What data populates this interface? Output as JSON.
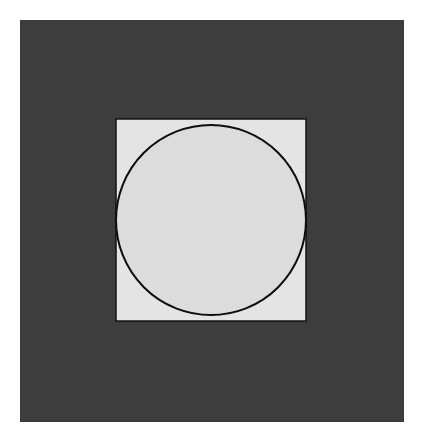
{
  "canvas": {
    "width": 421,
    "height": 442,
    "background_color": "#ffffff",
    "title": "Circle inscribed in square on dark background"
  },
  "chart_data": {
    "type": "diagram",
    "subtitle": "",
    "xlabel": "",
    "ylabel": "",
    "grid": false,
    "legend": null,
    "annotations": [],
    "shapes": [
      {
        "name": "outer-dark-panel",
        "type": "rect",
        "x": 20,
        "y": 20,
        "width": 384,
        "height": 402,
        "fill": "#3d3d3d",
        "stroke": "none",
        "stroke_width": 0
      },
      {
        "name": "inner-light-square",
        "type": "rect",
        "x": 116,
        "y": 119,
        "width": 190,
        "height": 202,
        "fill": "#e4e4e4",
        "stroke": "#121212",
        "stroke_width": 1.5
      },
      {
        "name": "inscribed-circle",
        "type": "circle",
        "cx": 211,
        "cy": 220,
        "r": 95,
        "fill": "#dcdcdc",
        "stroke": "#0d0d0d",
        "stroke_width": 2
      }
    ]
  },
  "palette": {
    "page_background": "#ffffff",
    "panel_dark": "#3d3d3d",
    "square_light": "#e4e4e4",
    "circle_fill": "#dcdcdc",
    "stroke_black": "#0d0d0d"
  },
  "labels": {
    "panel": "Dark background panel",
    "square": "Light square",
    "circle": "Inscribed circle"
  }
}
